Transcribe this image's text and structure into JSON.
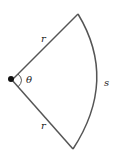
{
  "diagram": {
    "labels": {
      "radius_top": "r",
      "radius_bottom": "r",
      "angle": "θ",
      "arc": "s"
    },
    "colors": {
      "stroke": "#555555",
      "vertex": "#111111",
      "text": "#222222"
    }
  }
}
